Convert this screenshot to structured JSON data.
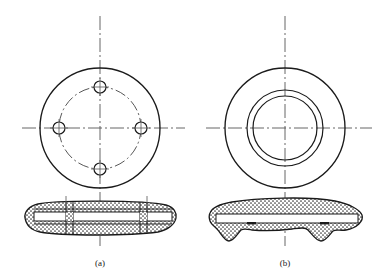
{
  "figure": {
    "kind": "engineering-drawing",
    "background_color": "#ffffff",
    "line_color": "#1a1a1a",
    "centerline_color": "#555555",
    "hatch_color": "#333333",
    "width": 389,
    "height": 277,
    "caption_a": "(a)",
    "caption_b": "(b)"
  },
  "views": {
    "a": {
      "label": "(a)",
      "name": "flange-with-bolt-holes",
      "front_view": {
        "center_x": 100,
        "center_y": 128,
        "outer_radius": 60,
        "bolt_circle_radius": 41,
        "hole_radius": 6,
        "hole_count": 4,
        "hole_positions": [
          "top",
          "right",
          "bottom",
          "left"
        ]
      },
      "section_view": {
        "center_x": 100,
        "center_y": 218,
        "half_length": 77,
        "thickness": 22,
        "description": "thin stippled section, flat plate with internal cavity lines"
      }
    },
    "b": {
      "label": "(b)",
      "name": "flange-with-concentric-bores",
      "front_view": {
        "center_x": 285,
        "center_y": 128,
        "outer_radius": 60,
        "middle_radius": 38,
        "inner_radius": 32
      },
      "section_view": {
        "center_x": 285,
        "center_y": 218,
        "half_length": 77,
        "thickness": 24,
        "description": "stippled section with two downward tapered ribs"
      }
    }
  },
  "centerlines": {
    "horizontal_y": 128,
    "vertical_a_x": 100,
    "vertical_b_x": 285,
    "dash_pattern": "10 3 2 3"
  }
}
